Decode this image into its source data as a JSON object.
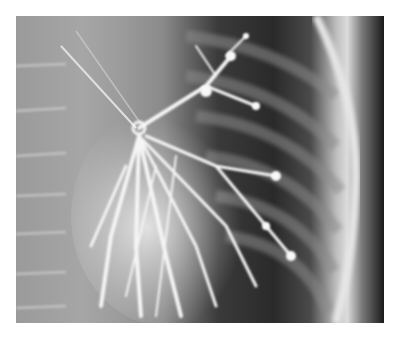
{
  "image": {
    "type": "radiograph",
    "subject": "chest bronchogram",
    "description": "Grayscale chest X-ray showing contrast-filled bronchial tree, ribs and spine",
    "colors": {
      "background": "#ffffff",
      "soft_tissue": "#9a9a9a",
      "lung_field": "#2a2a2a",
      "contrast": "#f2f2f2",
      "border_dark": "#1a1a1a"
    }
  }
}
